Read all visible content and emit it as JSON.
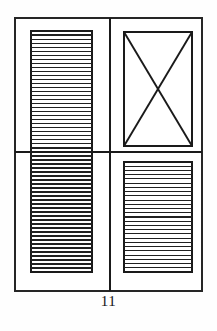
{
  "figure": {
    "caption": "11",
    "colors": {
      "page_background": "#fefefe",
      "panel_fill": "#ffffff",
      "line": "#1a1a1a",
      "slat_line": "#202020",
      "frame_line": "#262626"
    },
    "frame": {
      "name": "outer-frame",
      "x": 15,
      "y": 18,
      "width": 187,
      "height": 273,
      "stroke_width": 1.6
    },
    "dividers": {
      "vertical_x": 110,
      "horizontal_y": 152,
      "stroke_width": 1.1
    },
    "quadrants": [
      {
        "id": "top-left",
        "type": "louver",
        "label": "Louvered panel",
        "x": 31,
        "y": 31,
        "width": 61,
        "height": 121,
        "slat_count": 30,
        "border_width": 1.6,
        "slat_width": 1.1
      },
      {
        "id": "top-right",
        "type": "cross-braced",
        "label": "X-braced panel",
        "x": 124,
        "y": 32,
        "width": 68,
        "height": 114,
        "border_width": 1.6,
        "brace_width": 1.9
      },
      {
        "id": "bottom-left",
        "type": "louver",
        "label": "Louvered panel",
        "x": 31,
        "y": 152,
        "width": 61,
        "height": 120,
        "slat_count": 30,
        "border_width": 1.6,
        "slat_width": 1.1
      },
      {
        "id": "bottom-right",
        "type": "louver",
        "label": "Louvered panel",
        "x": 124,
        "y": 162,
        "width": 68,
        "height": 110,
        "slat_count": 26,
        "border_width": 1.6,
        "slat_width": 1.1
      }
    ]
  }
}
